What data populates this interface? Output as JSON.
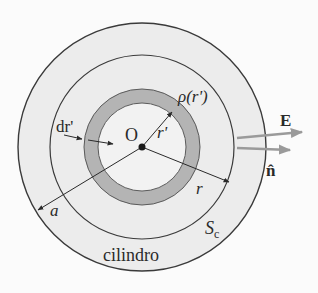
{
  "diagram": {
    "center_label": "O",
    "labels": {
      "rho": "ρ(r')",
      "r_prime": "r'",
      "dr_prime": "dr'",
      "r": "r",
      "a": "a",
      "surface": "S",
      "surface_sub": "c",
      "cylinder": "cilindro",
      "field": "E",
      "normal": "n̂"
    },
    "colors": {
      "background": "#fbfbfb",
      "cylinder_fill": "#ececec",
      "shell_fill": "#b4b4b4",
      "stroke": "#3a3a3a",
      "vector_arrows": "#9a9a9a"
    },
    "geometry": {
      "center": [
        142,
        147
      ],
      "outer_radius_a": 124,
      "gauss_surface_radius_r": 92,
      "shell_outer_radius": 58,
      "shell_inner_radius": 44
    }
  }
}
